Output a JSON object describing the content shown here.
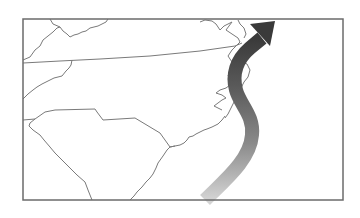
{
  "map": {
    "type": "regional-outline-map",
    "region": "US Southeast Atlantic coast",
    "states_shown": [
      "Virginia",
      "North Carolina",
      "South Carolina",
      "Tennessee",
      "Georgia",
      "Kentucky",
      "West Virginia",
      "Maryland",
      "Delaware"
    ],
    "frame": {
      "x": 23,
      "y": 19,
      "width": 320,
      "height": 181,
      "stroke": "#6b6b6b"
    },
    "colors": {
      "border_lines": "#7a7a7a",
      "arrow_dark": "#3c3c3c",
      "arrow_light": "#cfcfcf",
      "background": "#ffffff"
    },
    "arrow": {
      "description": "curved gradient arrow along coast pointing northeast",
      "direction": "northeast"
    }
  }
}
